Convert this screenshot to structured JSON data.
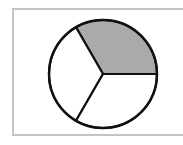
{
  "diagram": {
    "title": "",
    "total_parts": 3,
    "shaded_parts": 1,
    "fraction_shaded": "1/3",
    "parts": [
      {
        "name": "part-1",
        "shaded": true
      },
      {
        "name": "part-2",
        "shaded": false
      },
      {
        "name": "part-3",
        "shaded": false
      }
    ],
    "colors": {
      "shaded": "#aaaaaa",
      "unshaded": "#ffffff",
      "outline": "#111111",
      "frame": "#c4c4c4"
    }
  }
}
